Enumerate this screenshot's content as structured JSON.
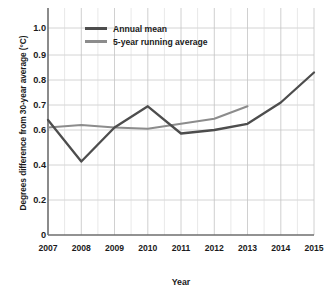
{
  "chart_data": {
    "type": "line",
    "title": "",
    "xlabel": "Year",
    "ylabel": "Degrees difference from 30-year average (°C)",
    "x": [
      2007,
      2008,
      2009,
      2010,
      2011,
      2012,
      2013,
      2014,
      2015
    ],
    "xticklabels": [
      "2007",
      "2008",
      "2009",
      "2010",
      "2011",
      "2012",
      "2013",
      "2014",
      "2015"
    ],
    "xlim": [
      2007,
      2015
    ],
    "yticklabels": [
      "1.0",
      "0.9",
      "0.8",
      "0.7",
      "0.6",
      "0.4",
      "0.2",
      "0"
    ],
    "ytickvalues": [
      1.0,
      0.9,
      0.8,
      0.7,
      0.6,
      0.4,
      0.2,
      0
    ],
    "ylim": [
      0,
      1.08
    ],
    "y_axis_note": "non-linear: compressed spacing below 0.6",
    "grid": true,
    "legend_position": "top-left inside axes",
    "series": [
      {
        "name": "Annual mean",
        "color": "#4d4d4d",
        "x": [
          2007,
          2008,
          2009,
          2010,
          2011,
          2012,
          2013,
          2014,
          2015
        ],
        "values": [
          0.64,
          0.42,
          0.61,
          0.695,
          0.58,
          0.6,
          0.625,
          0.71,
          0.83
        ]
      },
      {
        "name": "5-year running average",
        "color": "#8c8c8c",
        "x": [
          2007,
          2008,
          2009,
          2010,
          2011,
          2012,
          2013
        ],
        "values": [
          0.61,
          0.62,
          0.61,
          0.605,
          0.625,
          0.645,
          0.695
        ]
      }
    ]
  },
  "legend": {
    "items": [
      {
        "label": "Annual mean",
        "color": "#4d4d4d"
      },
      {
        "label": "5-year running average",
        "color": "#8c8c8c"
      }
    ]
  },
  "axes": {
    "y_title": "Degrees difference from 30-year average (°C)",
    "x_title": "Year",
    "y_labels": [
      "1.0",
      "0.9",
      "0.8",
      "0.7",
      "0.6",
      "0.4",
      "0.2",
      "0"
    ],
    "x_labels": [
      "2007",
      "2008",
      "2009",
      "2010",
      "2011",
      "2012",
      "2013",
      "2014",
      "2015"
    ]
  },
  "colors": {
    "annual_mean": "#4d4d4d",
    "running_average": "#8c8c8c",
    "grid": "#c9c9c9",
    "axis": "#6e6e6e",
    "background": "#ffffff"
  }
}
